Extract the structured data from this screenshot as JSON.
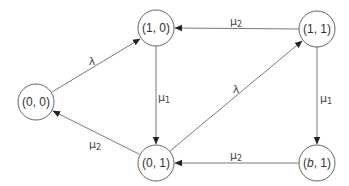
{
  "diagram": {
    "type": "state-transition",
    "nodes": [
      {
        "id": "n00",
        "label": "(0, 0)",
        "cx": 36,
        "cy": 102
      },
      {
        "id": "n10",
        "label": "(1, 0)",
        "cx": 156,
        "cy": 28
      },
      {
        "id": "n01",
        "label": "(0, 1)",
        "cx": 156,
        "cy": 163
      },
      {
        "id": "n11",
        "label": "(1, 1)",
        "cx": 317,
        "cy": 29
      },
      {
        "id": "nb1",
        "label_pre": "(",
        "label_var": "b",
        "label_post": ", 1)",
        "cx": 317,
        "cy": 163
      }
    ],
    "edges": [
      {
        "from": "(0, 0)",
        "to": "(1, 0)",
        "label": "λ"
      },
      {
        "from": "(1, 0)",
        "to": "(0, 1)",
        "label": "μ",
        "sub": "1"
      },
      {
        "from": "(0, 1)",
        "to": "(0, 0)",
        "label": "μ",
        "sub": "2"
      },
      {
        "from": "(0, 1)",
        "to": "(1, 1)",
        "label": "λ"
      },
      {
        "from": "(1, 1)",
        "to": "(1, 0)",
        "label": "μ",
        "sub": "2"
      },
      {
        "from": "(1, 1)",
        "to": "(b, 1)",
        "label": "μ",
        "sub": "1"
      },
      {
        "from": "(b, 1)",
        "to": "(0, 1)",
        "label": "μ",
        "sub": "2"
      }
    ]
  },
  "labels": {
    "n00": "(0, 0)",
    "n10": "(1, 0)",
    "n01": "(0, 1)",
    "n11": "(1, 1)",
    "nb1_pre": "(",
    "nb1_var": "b",
    "nb1_post": ", 1)",
    "lambda": "λ",
    "mu": "μ",
    "one": "1",
    "two": "2"
  }
}
